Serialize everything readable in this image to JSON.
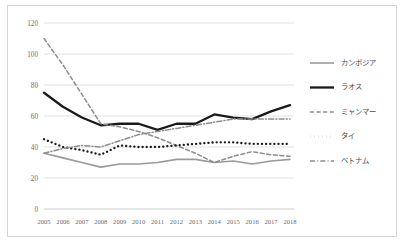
{
  "chart_data": {
    "type": "line",
    "title": "",
    "subtitle": "",
    "xlabel": "",
    "ylabel": "",
    "categories": [
      "2005",
      "2006",
      "2007",
      "2008",
      "2009",
      "2010",
      "2011",
      "2012",
      "2013",
      "2014",
      "2015",
      "2016",
      "2017",
      "2018"
    ],
    "ylim": [
      0,
      120
    ],
    "yticks": [
      0,
      20,
      40,
      60,
      80,
      100,
      120
    ],
    "grid": "horizontal",
    "legend_position": "right",
    "series": [
      {
        "name": "カンボジア",
        "style": "solid",
        "color": "#9a9a9a",
        "width": 1.6,
        "values": [
          36,
          33,
          30,
          27,
          29,
          29,
          30,
          32,
          32,
          30,
          31,
          29,
          31,
          32
        ]
      },
      {
        "name": "ラオス",
        "style": "solid",
        "color": "#1a1a1a",
        "width": 2.3,
        "values": [
          75,
          66,
          59,
          54,
          55,
          55,
          51,
          55,
          55,
          61,
          59,
          58,
          63,
          67
        ]
      },
      {
        "name": "ミャンマー",
        "style": "dashed",
        "color": "#8d8d8d",
        "width": 1.5,
        "values": [
          110,
          93,
          74,
          55,
          53,
          50,
          46,
          41,
          36,
          30,
          34,
          37,
          35,
          34
        ]
      },
      {
        "name": "タイ",
        "style": "dotted",
        "color": "#1a1a1a",
        "width": 2.3,
        "values": [
          45,
          40,
          38,
          35,
          41,
          40,
          40,
          41,
          42,
          43,
          43,
          42,
          42,
          42
        ]
      },
      {
        "name": "ベトナム",
        "style": "dashdot",
        "color": "#8d8d8d",
        "width": 1.5,
        "values": [
          36,
          39,
          41,
          40,
          44,
          48,
          50,
          52,
          54,
          56,
          58,
          58,
          58,
          58
        ]
      }
    ]
  },
  "axes": {
    "y_tick_labels": [
      "0",
      "20",
      "40",
      "60",
      "80",
      "100",
      "120"
    ],
    "x_tick_labels": [
      "2005",
      "2006",
      "2007",
      "2008",
      "2009",
      "2010",
      "2011",
      "2012",
      "2013",
      "2014",
      "2015",
      "2016",
      "2017",
      "2018"
    ]
  },
  "legend": {
    "items": [
      {
        "label": "カンボジア"
      },
      {
        "label": "ラオス"
      },
      {
        "label": "ミャンマー"
      },
      {
        "label": "タイ"
      },
      {
        "label": "ベトナム"
      }
    ]
  }
}
